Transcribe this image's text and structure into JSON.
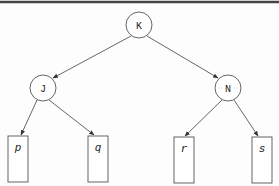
{
  "diagram": {
    "type": "binary-tree",
    "colors": {
      "stroke": "#555555",
      "border": "#333333",
      "fill": "#ffffff",
      "text": "#222222"
    },
    "internal_nodes": [
      {
        "id": "K",
        "label": "K",
        "cx": 139,
        "cy": 25,
        "r": 13
      },
      {
        "id": "J",
        "label": "J",
        "cx": 43,
        "cy": 88,
        "r": 13
      },
      {
        "id": "N",
        "label": "N",
        "cx": 228,
        "cy": 88,
        "r": 13
      }
    ],
    "leaves": [
      {
        "id": "p",
        "label": "p",
        "x": 8,
        "y": 136,
        "w": 20,
        "h": 46
      },
      {
        "id": "q",
        "label": "q",
        "x": 88,
        "y": 136,
        "w": 20,
        "h": 46
      },
      {
        "id": "r",
        "label": "r",
        "x": 174,
        "y": 137,
        "w": 20,
        "h": 46
      },
      {
        "id": "s",
        "label": "s",
        "x": 252,
        "y": 137,
        "w": 20,
        "h": 46
      }
    ],
    "edges": [
      {
        "from": "K",
        "to": "J"
      },
      {
        "from": "K",
        "to": "N"
      },
      {
        "from": "J",
        "to": "p"
      },
      {
        "from": "J",
        "to": "q"
      },
      {
        "from": "N",
        "to": "r"
      },
      {
        "from": "N",
        "to": "s"
      }
    ]
  }
}
